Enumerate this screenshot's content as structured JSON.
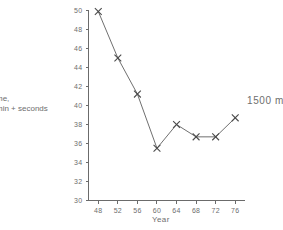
{
  "chart_data": {
    "type": "line",
    "title": "",
    "subtitle": "",
    "xlabel": "Year",
    "ylabel": "me,\nmin + seconds",
    "ylabel_full": "Time, min + seconds",
    "annotation": "1500 m",
    "grid": false,
    "legend": "none",
    "xlim": [
      46,
      78
    ],
    "ylim": [
      30,
      50
    ],
    "x": [
      48,
      52,
      56,
      60,
      64,
      68,
      72,
      76
    ],
    "xticks": [
      48,
      52,
      56,
      60,
      64,
      68,
      72,
      76
    ],
    "xticklabels": [
      "48",
      "52",
      "56",
      "60",
      "64",
      "68",
      "72",
      "76"
    ],
    "yticks": [
      30,
      32,
      34,
      36,
      38,
      40,
      42,
      44,
      46,
      48,
      50
    ],
    "yticklabels": [
      "30",
      "32",
      "34",
      "36",
      "38",
      "40",
      "42",
      "44",
      "46",
      "48",
      "50"
    ],
    "series": [
      {
        "name": "1500 m",
        "marker": "x",
        "values": [
          49.9,
          45.0,
          41.2,
          35.5,
          38.0,
          36.7,
          36.7,
          38.7
        ]
      }
    ],
    "colors": {
      "axis": "#6b6b6b",
      "line": "#5f5f5f",
      "marker": "#4a4a4a",
      "text": "#6e6e6e",
      "background": "#ffffff"
    }
  },
  "labels": {
    "y_caption_line1": "me,",
    "y_caption_line2": "min + seconds",
    "x_title": "Year",
    "annotation": "1500 m"
  }
}
